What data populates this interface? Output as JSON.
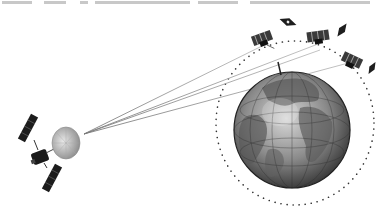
{
  "figure": {
    "top_text_cropped": true,
    "elements": {
      "relay_satellite": {
        "label": "relay-satellite",
        "x": 45,
        "y": 155
      },
      "dish_antenna": {
        "label": "dish-antenna",
        "x": 66,
        "y": 143
      },
      "earth": {
        "label": "earth-globe",
        "cx": 292,
        "cy": 130,
        "r": 58
      },
      "orbit": {
        "label": "dotted-orbit",
        "cx": 295,
        "cy": 123,
        "rx": 78,
        "ry": 82
      },
      "leo_satellites": [
        {
          "label": "leo-satellite-1",
          "x": 262,
          "y": 38
        },
        {
          "label": "leo-satellite-2",
          "x": 317,
          "y": 36
        },
        {
          "label": "leo-satellite-3",
          "x": 352,
          "y": 60
        }
      ],
      "reflector_panels": [
        {
          "label": "panel-1",
          "x": 288,
          "y": 22
        },
        {
          "label": "panel-2",
          "x": 342,
          "y": 30
        },
        {
          "label": "panel-3",
          "x": 372,
          "y": 70
        }
      ],
      "beams": {
        "count": 4,
        "origin_x": 84,
        "origin_y": 133
      }
    }
  },
  "colors": {
    "background": "#ffffff",
    "earth_ocean": "#6f6f6f",
    "earth_land": "#9c9c9c",
    "ink": "#222222",
    "beam": "#8a8a8a"
  }
}
